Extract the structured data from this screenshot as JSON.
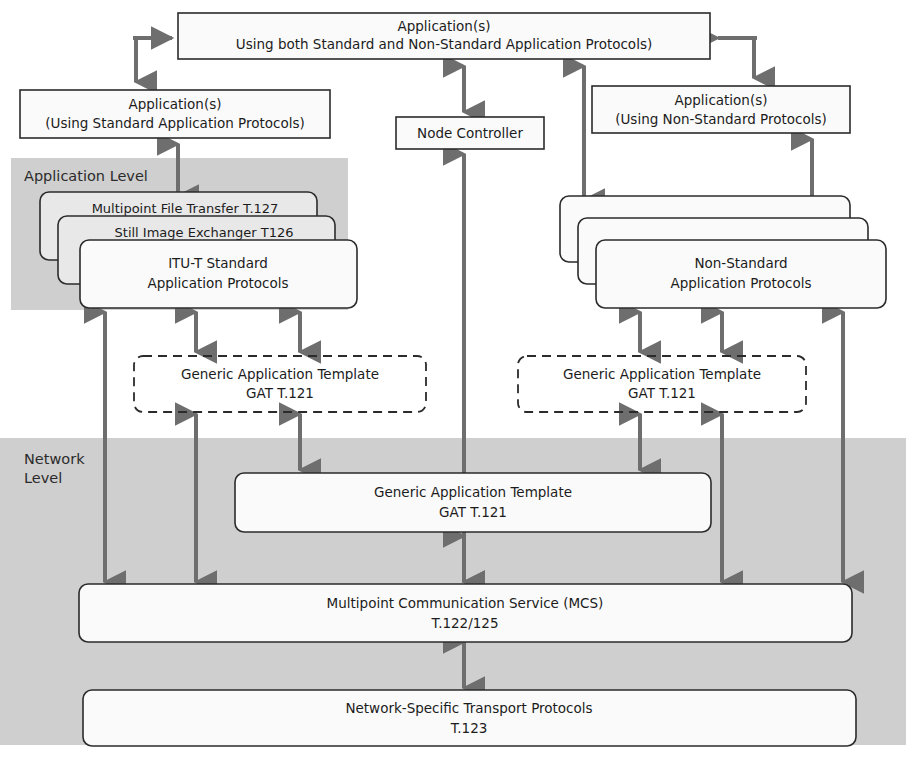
{
  "diagram": {
    "levels": [
      {
        "id": "application-level",
        "label": "Application Level"
      },
      {
        "id": "network-level",
        "label_line1": "Network",
        "label_line2": "Level"
      }
    ],
    "boxes": {
      "app_both": {
        "line1": "Application(s)",
        "line2": "Using both Standard and Non-Standard Application Protocols)"
      },
      "app_standard": {
        "line1": "Application(s)",
        "line2": "(Using Standard Application Protocols)"
      },
      "app_nonstandard": {
        "line1": "Application(s)",
        "line2": "(Using Non-Standard Protocols)"
      },
      "node_controller": {
        "line1": "Node Controller"
      },
      "std_stack": {
        "card_top": "Multipoint File Transfer T.127",
        "card_mid": "Still Image Exchanger T126",
        "card_front_line1": "ITU-T Standard",
        "card_front_line2": "Application Protocols"
      },
      "nonstd_stack": {
        "card_top": "",
        "card_mid": "",
        "card_front_line1": "Non-Standard",
        "card_front_line2": "Application Protocols"
      },
      "gat_left": {
        "line1": "Generic Application Template",
        "line2": "GAT T.121"
      },
      "gat_right": {
        "line1": "Generic Application Template",
        "line2": "GAT T.121"
      },
      "gat_center": {
        "line1": "Generic Application Template",
        "line2": "GAT T.121"
      },
      "mcs": {
        "line1": "Multipoint Communication Service (MCS)",
        "line2": "T.122/125"
      },
      "transport": {
        "line1": "Network-Specific Transport Protocols",
        "line2": "T.123"
      }
    },
    "colors": {
      "band_gray": "#cfcfcf",
      "box_stroke": "#2b2b2b",
      "box_fill": "#fafafa",
      "arrow": "#6e6e6e",
      "text": "#1c1c1c",
      "background": "#ffffff"
    }
  }
}
